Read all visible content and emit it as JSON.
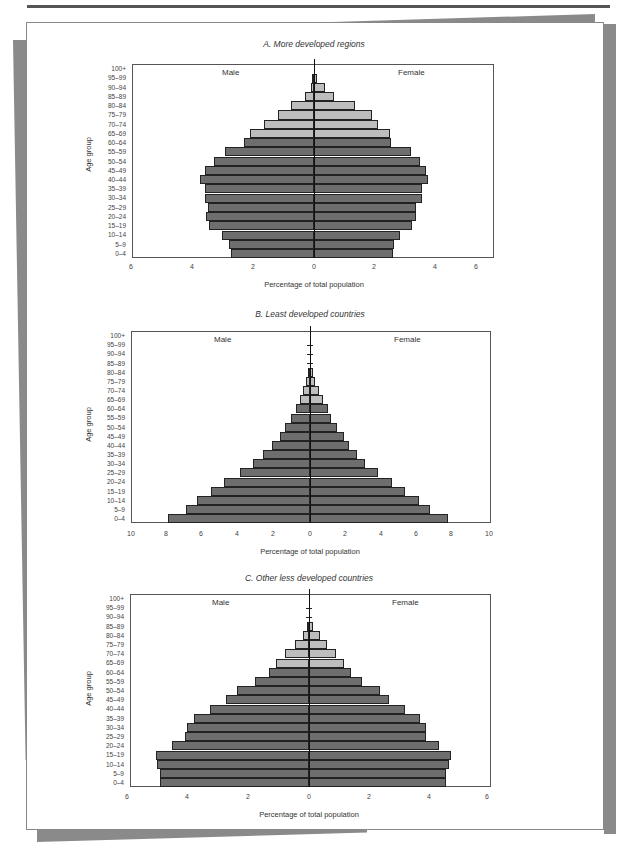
{
  "chart_data": [
    {
      "type": "bar",
      "orientation": "horizontal-population-pyramid",
      "title": "A. More developed regions",
      "xlabel": "Percentage of total population",
      "ylabel": "Age group",
      "left_label": "Male",
      "right_label": "Female",
      "xlim": [
        -6,
        6
      ],
      "x_tick_labels": [
        "6",
        "4",
        "2",
        "0",
        "2",
        "4",
        "6"
      ],
      "categories": [
        "100+",
        "95–99",
        "90–94",
        "85–89",
        "80–84",
        "75–79",
        "70–74",
        "65–69",
        "60–64",
        "55–59",
        "50–54",
        "45–49",
        "40–44",
        "35–39",
        "30–34",
        "25–29",
        "20–24",
        "15–19",
        "10–14",
        "5–9",
        "0–4"
      ],
      "series": [
        {
          "name": "Male",
          "values": [
            0.0,
            0.05,
            0.1,
            0.3,
            0.75,
            1.2,
            1.65,
            2.1,
            2.3,
            2.95,
            3.3,
            3.6,
            3.75,
            3.6,
            3.6,
            3.5,
            3.55,
            3.45,
            3.05,
            2.8,
            2.75
          ]
        },
        {
          "name": "Female",
          "values": [
            0.0,
            0.1,
            0.35,
            0.65,
            1.35,
            1.9,
            2.1,
            2.5,
            2.55,
            3.2,
            3.5,
            3.7,
            3.75,
            3.55,
            3.55,
            3.35,
            3.35,
            3.25,
            2.85,
            2.65,
            2.6
          ]
        }
      ],
      "shading_note": "Age groups 65+ shaded light gray; under 65 dark gray",
      "grid": false
    },
    {
      "type": "bar",
      "orientation": "horizontal-population-pyramid",
      "title": "B. Least developed countries",
      "xlabel": "Percentage of total population",
      "ylabel": "Age group",
      "left_label": "Male",
      "right_label": "Female",
      "xlim": [
        -10,
        10
      ],
      "x_tick_labels": [
        "10",
        "8",
        "6",
        "4",
        "2",
        "0",
        "2",
        "4",
        "6",
        "8",
        "10"
      ],
      "categories": [
        "100+",
        "95–99",
        "90–94",
        "85–89",
        "80–84",
        "75–79",
        "70–74",
        "65–69",
        "60–64",
        "55–59",
        "50–54",
        "45–49",
        "40–44",
        "35–39",
        "30–34",
        "25–29",
        "20–24",
        "15–19",
        "10–14",
        "5–9",
        "0–4"
      ],
      "series": [
        {
          "name": "Male",
          "values": [
            0.0,
            0.01,
            0.02,
            0.05,
            0.1,
            0.2,
            0.4,
            0.55,
            0.8,
            1.05,
            1.4,
            1.7,
            2.1,
            2.6,
            3.2,
            3.9,
            4.8,
            5.55,
            6.3,
            6.9,
            7.95
          ]
        },
        {
          "name": "Female",
          "values": [
            0.0,
            0.01,
            0.03,
            0.07,
            0.15,
            0.3,
            0.5,
            0.75,
            1.0,
            1.2,
            1.5,
            1.9,
            2.2,
            2.6,
            3.1,
            3.8,
            4.6,
            5.3,
            6.1,
            6.7,
            7.7
          ]
        }
      ],
      "shading_note": "Age groups 65+ shaded light gray; under 65 dark gray",
      "grid": false
    },
    {
      "type": "bar",
      "orientation": "horizontal-population-pyramid",
      "title": "C. Other less developed countries",
      "xlabel": "Percentage of total population",
      "ylabel": "Age group",
      "left_label": "Male",
      "right_label": "Female",
      "xlim": [
        -6,
        6
      ],
      "x_tick_labels": [
        "6",
        "4",
        "2",
        "0",
        "2",
        "4",
        "6"
      ],
      "categories": [
        "100+",
        "95–99",
        "90–94",
        "85–89",
        "80–84",
        "75–79",
        "70–74",
        "65–69",
        "60–64",
        "55–59",
        "50–54",
        "45–49",
        "40–44",
        "35–39",
        "30–34",
        "25–29",
        "20–24",
        "15–19",
        "10–14",
        "5–9",
        "0–4"
      ],
      "series": [
        {
          "name": "Male",
          "values": [
            0.0,
            0.01,
            0.03,
            0.07,
            0.2,
            0.46,
            0.8,
            1.08,
            1.32,
            1.79,
            2.38,
            2.76,
            3.29,
            3.81,
            4.03,
            4.12,
            4.53,
            5.07,
            5.02,
            4.94,
            4.95
          ]
        },
        {
          "name": "Female",
          "values": [
            0.0,
            0.01,
            0.04,
            0.13,
            0.35,
            0.6,
            0.88,
            1.17,
            1.39,
            1.74,
            2.34,
            2.65,
            3.18,
            3.67,
            3.86,
            3.89,
            4.29,
            4.7,
            4.64,
            4.55,
            4.53
          ]
        }
      ],
      "shading_note": "Age groups 65+ shaded light gray; under 65 dark gray",
      "grid": false
    }
  ],
  "colors": {
    "dark_bar": "#6e6e6e",
    "light_bar": "#bdbdbd",
    "bar_border": "#222222",
    "frame": "#555555",
    "shadow": "#8a8a8a"
  }
}
